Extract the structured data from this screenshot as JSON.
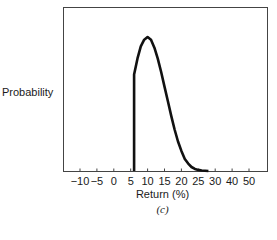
{
  "chart_data": {
    "type": "line",
    "title": "",
    "xlabel": "Return (%)",
    "ylabel": "Probability",
    "panel_label": "(c)",
    "x_ticks": [
      "-10",
      "-5",
      "0",
      "5",
      "10",
      "15",
      "20",
      "25",
      "30",
      "40",
      "50"
    ],
    "grid": false,
    "legend": null,
    "series": [
      {
        "name": "Return distribution",
        "description": "Truncated right-skewed distribution: zero below ~6%, jumps up at ~6%, peaks near 10%, tails off to ~0 by ~28%",
        "x": [
          6,
          6,
          7,
          8,
          9,
          10,
          11,
          12,
          13,
          14,
          15,
          16,
          17,
          18,
          19,
          20,
          21,
          22,
          23,
          24,
          25,
          26,
          27,
          28
        ],
        "y": [
          0,
          0.72,
          0.84,
          0.93,
          0.98,
          1.0,
          0.98,
          0.92,
          0.84,
          0.74,
          0.63,
          0.52,
          0.41,
          0.31,
          0.22,
          0.15,
          0.09,
          0.055,
          0.03,
          0.016,
          0.008,
          0.004,
          0.002,
          0.0
        ]
      }
    ]
  }
}
